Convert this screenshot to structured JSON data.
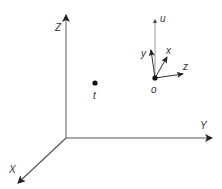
{
  "diagram": {
    "type": "coordinate-frames",
    "colors": {
      "axis": "#555555",
      "local_axis": "#333333",
      "u_axis": "#999999",
      "text": "#333333",
      "point": "#111111"
    },
    "global_frame": {
      "origin": [
        66,
        138
      ],
      "axes": [
        {
          "name": "Z",
          "label": "Z",
          "end": [
            66,
            15
          ],
          "label_pos": [
            55,
            31
          ]
        },
        {
          "name": "Y",
          "label": "Y",
          "end": [
            212,
            138
          ],
          "label_pos": [
            200,
            129
          ]
        },
        {
          "name": "X",
          "label": "X",
          "end": [
            18,
            183
          ],
          "label_pos": [
            9,
            173
          ]
        }
      ]
    },
    "point_t": {
      "label": "t",
      "position": [
        95,
        83
      ],
      "label_pos": [
        93,
        99
      ]
    },
    "local_frame": {
      "origin_label": "o",
      "origin": [
        155,
        78
      ],
      "origin_label_pos": [
        151,
        93
      ],
      "axes": [
        {
          "name": "u",
          "label": "u",
          "end": [
            155,
            20
          ],
          "label_pos": [
            160,
            22
          ]
        },
        {
          "name": "y",
          "label": "y",
          "end": [
            151,
            50
          ],
          "label_pos": [
            141,
            57
          ]
        },
        {
          "name": "x",
          "label": "x",
          "end": [
            167,
            57
          ],
          "label_pos": [
            166,
            54
          ]
        },
        {
          "name": "z",
          "label": "z",
          "end": [
            183,
            74
          ],
          "label_pos": [
            183,
            70
          ]
        }
      ]
    }
  }
}
